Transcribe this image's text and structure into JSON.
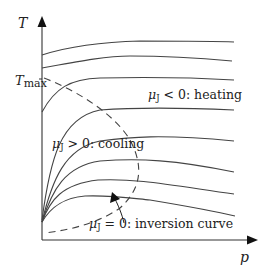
{
  "diagram": {
    "axes": {
      "y_label": "T",
      "x_label": "p",
      "y_tick_label_main": "T",
      "y_tick_label_sub": "max"
    },
    "annotations": {
      "heating": {
        "mu": "μ",
        "sub": "J",
        "rest": " < 0: heating"
      },
      "cooling": {
        "mu": "μ",
        "sub": "J",
        "rest": " > 0: cooling"
      },
      "inversion": {
        "mu": "μ",
        "sub": "J",
        "rest": " = 0: inversion curve"
      }
    },
    "colors": {
      "line": "#444444",
      "text": "#222222",
      "axis": "#333333"
    },
    "isenthalp_count": 8
  }
}
